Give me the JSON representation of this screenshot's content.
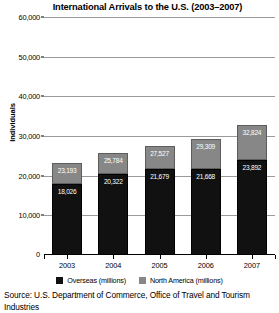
{
  "chart_data": {
    "type": "bar",
    "stacked": true,
    "title": "International Arrivals to the U.S. (2003–2007)",
    "xlabel": "",
    "ylabel": "Individuals",
    "categories": [
      "2003",
      "2004",
      "2005",
      "2006",
      "2007"
    ],
    "ylim": [
      0,
      60000
    ],
    "yticks": [
      0,
      10000,
      20000,
      30000,
      40000,
      50000,
      60000
    ],
    "ytick_labels": [
      "0",
      "10,000",
      "20,000",
      "30,000",
      "40,000",
      "50,000",
      "60,000"
    ],
    "grid": true,
    "legend_position": "bottom",
    "series": [
      {
        "name": "Overseas (millions)",
        "color": "#111111",
        "values": [
          18026,
          20322,
          21679,
          21668,
          23892
        ],
        "value_labels": [
          "18,026",
          "20,322",
          "21,679",
          "21,668",
          "23,892"
        ]
      },
      {
        "name": "North America (millions)",
        "color": "#878787",
        "values": [
          5167,
          5462,
          5848,
          7641,
          8932
        ],
        "value_labels": [
          "",
          "",
          "",
          "",
          ""
        ]
      }
    ],
    "stack_totals": [
      23193,
      25784,
      27527,
      29309,
      32824
    ],
    "stack_total_labels": [
      "23,193",
      "25,784",
      "27,527",
      "29,309",
      "32,824"
    ],
    "source_note": "Source: U.S. Department of Commerce, Office of Travel and Tourism Industries"
  }
}
